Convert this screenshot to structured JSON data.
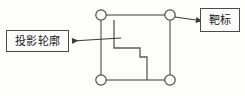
{
  "figure": {
    "width": 245,
    "height": 96,
    "background_color": "#fdfdfc",
    "stroke_color": "#4a4a4a",
    "text_color": "#1a1a1a"
  },
  "labels": {
    "projection_contour": {
      "text": "投影轮廓",
      "meaning": "projection contour"
    },
    "target": {
      "text": "靶标",
      "meaning": "target"
    }
  },
  "diagram": {
    "square": {
      "name": "target-square-frame",
      "left": 101,
      "top": 15,
      "right": 170,
      "bottom": 80
    },
    "corner_markers": [
      {
        "name": "corner-marker-top-left",
        "cx": 101,
        "cy": 15,
        "r": 5.2
      },
      {
        "name": "corner-marker-top-right",
        "cx": 170,
        "cy": 15,
        "r": 5.2
      },
      {
        "name": "corner-marker-bottom-left",
        "cx": 101,
        "cy": 80,
        "r": 5.2
      },
      {
        "name": "corner-marker-bottom-right",
        "cx": 170,
        "cy": 80,
        "r": 5.2
      }
    ],
    "stepped_contour": {
      "name": "projection-contour-path",
      "points": "114,20 114,48 140,48 140,57 147,57 147,80"
    },
    "leader_left": {
      "name": "leader-line-projection",
      "from_x": 120,
      "from_y": 38,
      "to_x": 72,
      "to_y": 41
    },
    "leader_right": {
      "name": "leader-line-target",
      "from_x": 174,
      "from_y": 17,
      "to_x": 196,
      "to_y": 20
    }
  }
}
